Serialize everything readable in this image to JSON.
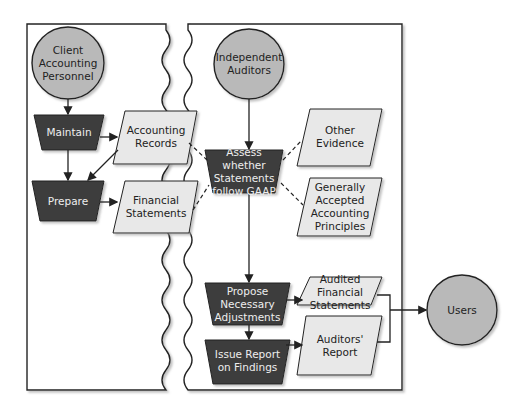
{
  "colors": {
    "circle_fill": "#b9b9b9",
    "process_fill": "#3d3d3d",
    "data_fill": "#e8e8e8",
    "stroke": "#222222"
  },
  "swimlanes": [
    {
      "name": "client-lane"
    },
    {
      "name": "auditor-lane"
    }
  ],
  "nodes": {
    "client": {
      "label": "Client\nAccounting\nPersonnel",
      "shape": "circle"
    },
    "auditors": {
      "label": "Independent\nAuditors",
      "shape": "circle"
    },
    "users": {
      "label": "Users",
      "shape": "circle"
    },
    "maintain": {
      "label": "Maintain",
      "shape": "process"
    },
    "prepare": {
      "label": "Prepare",
      "shape": "process"
    },
    "accounting_records": {
      "label": "Accounting\nRecords",
      "shape": "data"
    },
    "financial_statements": {
      "label": "Financial\nStatements",
      "shape": "data"
    },
    "assess": {
      "label": "Assess whether\nStatements\nfollow GAAP",
      "shape": "process"
    },
    "other_evidence": {
      "label": "Other\nEvidence",
      "shape": "data"
    },
    "gaap": {
      "label": "Generally\nAccepted\nAccounting\nPrinciples",
      "shape": "data"
    },
    "propose": {
      "label": "Propose\nNecessary\nAdjustments",
      "shape": "process"
    },
    "audited_fs": {
      "label": "Audited\nFinancial\nStatements",
      "shape": "data"
    },
    "issue_report": {
      "label": "Issue Report\non Findings",
      "shape": "process"
    },
    "auditors_report": {
      "label": "Auditors'\nReport",
      "shape": "data"
    }
  }
}
